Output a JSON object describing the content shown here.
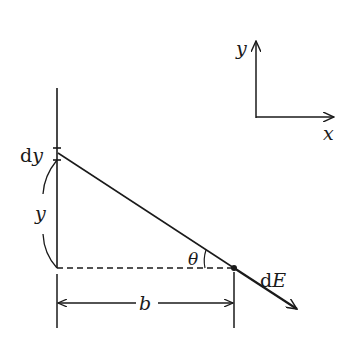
{
  "diagram": {
    "colors": {
      "ink": "#1a1a1a",
      "background": "#ffffff"
    },
    "labels": {
      "dy": "dy",
      "dy_d": "d",
      "dy_y": "y",
      "y": "y",
      "b": "b",
      "theta": "θ",
      "dE_d": "d",
      "dE_E": "E",
      "axis_y": "y",
      "axis_x": "x"
    }
  }
}
